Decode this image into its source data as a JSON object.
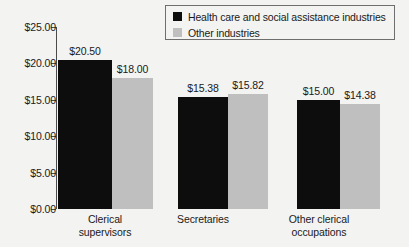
{
  "chart_data": {
    "type": "bar",
    "title": "",
    "subtitle": "",
    "xlabel": "",
    "ylabel": "",
    "ylim": [
      0,
      25
    ],
    "grid": false,
    "legend_position": "top-right",
    "categories": [
      "Clerical supervisors",
      "Secretaries",
      "Other clerical occupations"
    ],
    "category_lines": [
      [
        "Clerical",
        "supervisors"
      ],
      [
        "Secretaries",
        ""
      ],
      [
        "Other clerical",
        "occupations"
      ]
    ],
    "ytick_labels": [
      "$0.00",
      "$5.00",
      "$10.00",
      "$15.00",
      "$20.00",
      "$25.00"
    ],
    "ytick_values": [
      0,
      5,
      10,
      15,
      20,
      25
    ],
    "series": [
      {
        "name": "Health care and social assistance industries",
        "color": "#0d0d0d",
        "values": [
          20.5,
          15.38,
          15.0
        ],
        "labels": [
          "$20.50",
          "$15.38",
          "$15.00"
        ]
      },
      {
        "name": "Other industries",
        "color": "#bfbfbf",
        "values": [
          18.0,
          15.82,
          14.38
        ],
        "labels": [
          "$18.00",
          "$15.82",
          "$14.38"
        ]
      }
    ]
  },
  "legend": {
    "items": [
      {
        "label": "Health care and social assistance industries",
        "swatch": "dark"
      },
      {
        "label": "Other industries",
        "swatch": "light"
      }
    ]
  }
}
